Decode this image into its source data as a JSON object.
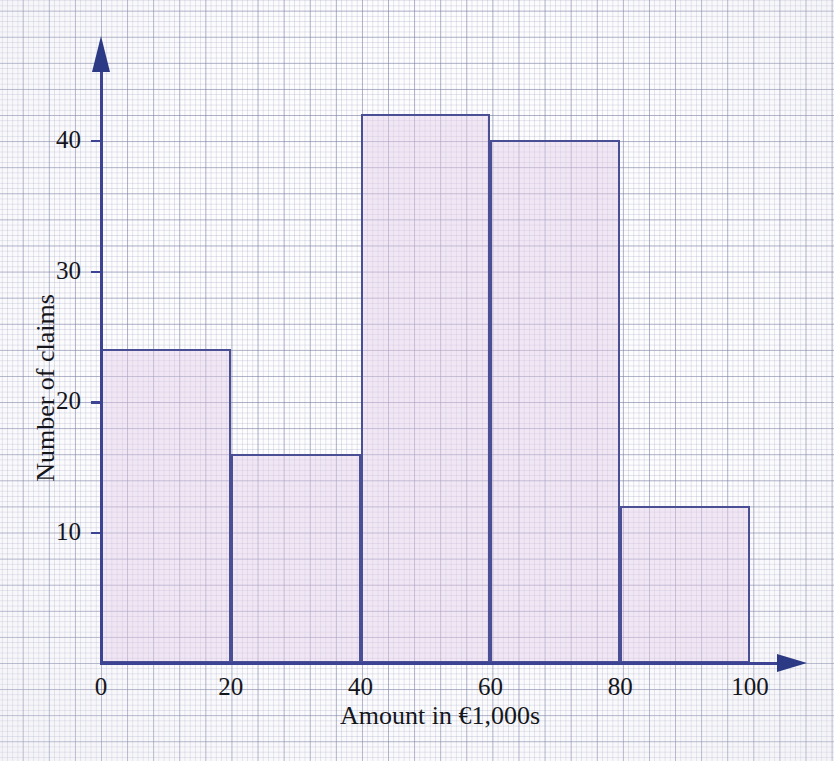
{
  "figure": {
    "medium": "graph-paper",
    "ink_color": "#3c4392",
    "bar_fill_color": "#ece1ef",
    "bar_edge_color": "#4a4e95",
    "text_color": "#15161c"
  },
  "chart_data": {
    "type": "bar",
    "title": "",
    "subtitle": "",
    "xlabel": "Amount in €1,000s",
    "ylabel": "Number of claims",
    "categories": [
      "0–20",
      "20–40",
      "40–60",
      "60–80",
      "80–100"
    ],
    "bin_edges": [
      0,
      20,
      40,
      60,
      80,
      100
    ],
    "values": [
      24,
      16,
      42,
      40,
      12
    ],
    "bin_width": 20,
    "xlim": [
      0,
      100
    ],
    "ylim": [
      0,
      45
    ],
    "xticks": [
      0,
      20,
      40,
      60,
      80,
      100
    ],
    "xtick_labels": [
      "0",
      "20",
      "40",
      "60",
      "80",
      "100"
    ],
    "yticks": [
      10,
      20,
      30,
      40
    ],
    "ytick_labels": [
      "10",
      "20",
      "30",
      "40"
    ],
    "grid": true,
    "legend": null,
    "annotations": []
  },
  "axes": {
    "x_arrow": "right-arrow-icon",
    "y_arrow": "up-arrow-icon"
  }
}
